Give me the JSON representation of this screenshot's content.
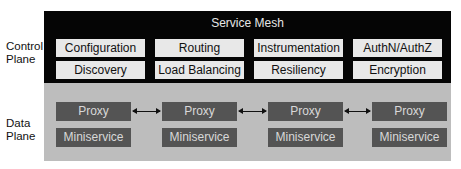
{
  "diagram": {
    "control_plane": {
      "label_line1": "Control",
      "label_line2": "Plane",
      "title": "Service Mesh",
      "rows": [
        [
          "Configuration",
          "Routing",
          "Instrumentation",
          "AuthN/AuthZ"
        ],
        [
          "Discovery",
          "Load Balancing",
          "Resiliency",
          "Encryption"
        ]
      ]
    },
    "data_plane": {
      "label_line1": "Data",
      "label_line2": "Plane",
      "nodes": [
        {
          "proxy": "Proxy",
          "service": "Miniservice"
        },
        {
          "proxy": "Proxy",
          "service": "Miniservice"
        },
        {
          "proxy": "Proxy",
          "service": "Miniservice"
        },
        {
          "proxy": "Proxy",
          "service": "Miniservice"
        }
      ],
      "connections": [
        {
          "from": 0,
          "to": 1,
          "type": "bidirectional"
        },
        {
          "from": 1,
          "to": 2,
          "type": "bidirectional"
        },
        {
          "from": 2,
          "to": 3,
          "type": "bidirectional"
        }
      ]
    },
    "colors": {
      "control_bg": "#050505",
      "control_box": "#e8e8e8",
      "data_bg": "#bdbdbd",
      "data_box": "#545454",
      "data_text": "#d8d8d8"
    }
  }
}
